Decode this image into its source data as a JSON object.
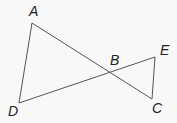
{
  "diagram": {
    "points": {
      "A": {
        "label": "A",
        "x": 32,
        "y": 23
      },
      "B": {
        "label": "B",
        "x": 110,
        "y": 73
      },
      "C": {
        "label": "C",
        "x": 152,
        "y": 99
      },
      "D": {
        "label": "D",
        "x": 19,
        "y": 103
      },
      "E": {
        "label": "E",
        "x": 155,
        "y": 57
      }
    },
    "segments": [
      "AD",
      "AC",
      "DE",
      "EC"
    ],
    "stroke_color": "#555555",
    "label_color": "#222222"
  }
}
